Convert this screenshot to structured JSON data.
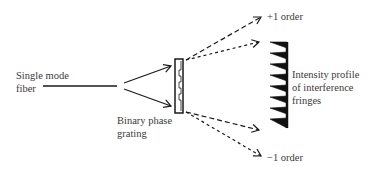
{
  "diagram": {
    "labels": {
      "fiber": {
        "line1": "Single mode",
        "line2": "fiber"
      },
      "grating": {
        "line1": "Binary phase",
        "line2": "grating"
      },
      "plus_order": "+1 order",
      "minus_order": "−1 order",
      "fringes": {
        "line1": "Intensity profile",
        "line2": "of interference",
        "line3": "fringes"
      }
    },
    "colors": {
      "stroke": "#1a1a1a",
      "text": "#3a3a3a",
      "background": "#ffffff"
    },
    "elements": {
      "fiber_line": "solid horizontal line representing single mode fiber",
      "incident_beams": "two solid arrows diverging from fiber end to grating",
      "grating": "vertical rectangle with binary step profile",
      "diffracted_orders": "four dashed arrows: two upper (+1 order), two lower (−1 order)",
      "fringe_profile": "sawtooth intensity profile with 8 teeth"
    },
    "fringe_teeth_count": 8
  }
}
